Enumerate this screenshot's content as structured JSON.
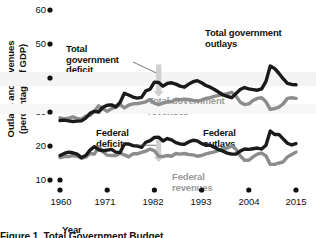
{
  "figure": {
    "caption": "Figure 1. Total Government Budget",
    "xlabel": "Year",
    "ylabel_line1": "Outlays and revenues",
    "ylabel_line2": "(percentage of GDP)"
  },
  "labels": {
    "total_deficit": "Total\ngovernment\ndeficit",
    "total_deficit_l1": "Total",
    "total_deficit_l2": "government",
    "total_deficit_l3": "deficit",
    "total_outlays_l1": "Total government",
    "total_outlays_l2": "outlays",
    "total_revenues_l1": "Total government",
    "total_revenues_l2": "revenues",
    "federal_deficit_l1": "Federal",
    "federal_deficit_l2": "deficit",
    "federal_outlays_l1": "Federal",
    "federal_outlays_l2": "outlays",
    "federal_revenues_l1": "Federal",
    "federal_revenues_l2": "revenues"
  },
  "colors": {
    "outlays": "#1a1a1a",
    "revenues": "#8c8c8c",
    "arrow": "#d0d0d0",
    "band": "#f2f2f2",
    "text": "#111111",
    "gray_text": "#9a9a9a"
  },
  "chart_data": {
    "type": "line",
    "title": "Figure 1. Total Government Budget",
    "xlabel": "Year",
    "ylabel": "Outlays and revenues (percentage of GDP)",
    "xlim": [
      1960,
      2015
    ],
    "ylim": [
      10,
      60
    ],
    "xticks": [
      1960,
      1971,
      1982,
      1993,
      2004,
      2015
    ],
    "yticks": [
      10,
      20,
      30,
      40,
      50,
      60
    ],
    "grid": false,
    "legend": "inline-annotations",
    "annotations": [
      {
        "text": "Total government deficit",
        "target": "gap between total outlays and total revenues",
        "year": 1983
      },
      {
        "text": "Federal deficit",
        "target": "gap between federal outlays and federal revenues",
        "year": 1983
      }
    ],
    "x": [
      1960,
      1961,
      1962,
      1963,
      1964,
      1965,
      1966,
      1967,
      1968,
      1969,
      1970,
      1971,
      1972,
      1973,
      1974,
      1975,
      1976,
      1977,
      1978,
      1979,
      1980,
      1981,
      1982,
      1983,
      1984,
      1985,
      1986,
      1987,
      1988,
      1989,
      1990,
      1991,
      1992,
      1993,
      1994,
      1995,
      1996,
      1997,
      1998,
      1999,
      2000,
      2001,
      2002,
      2003,
      2004,
      2005,
      2006,
      2007,
      2008,
      2009,
      2010,
      2011,
      2012,
      2013,
      2014,
      2015
    ],
    "series": [
      {
        "name": "Total government outlays",
        "color": "#1a1a1a",
        "values": [
          27.5,
          27.6,
          27.4,
          27.2,
          27.3,
          27.4,
          28.2,
          29.6,
          30.2,
          30.0,
          31.4,
          32.0,
          32.1,
          31.5,
          32.8,
          35.5,
          35.0,
          34.4,
          34.1,
          34.3,
          36.2,
          36.7,
          38.8,
          38.7,
          37.6,
          38.4,
          38.6,
          38.2,
          37.6,
          37.3,
          38.2,
          38.9,
          39.2,
          38.6,
          37.8,
          37.3,
          36.6,
          35.8,
          35.0,
          34.6,
          34.2,
          35.4,
          36.6,
          37.2,
          36.8,
          36.6,
          36.4,
          36.8,
          39.0,
          43.5,
          42.8,
          41.4,
          39.8,
          38.4,
          38.1,
          38.0
        ]
      },
      {
        "name": "Total government revenues",
        "color": "#8c8c8c",
        "values": [
          28.3,
          28.0,
          28.2,
          28.6,
          28.1,
          27.9,
          28.8,
          29.0,
          30.2,
          31.8,
          31.0,
          30.2,
          31.0,
          31.4,
          32.2,
          31.2,
          32.0,
          32.4,
          32.5,
          32.7,
          33.0,
          33.7,
          32.6,
          32.2,
          32.6,
          33.0,
          33.0,
          33.8,
          33.6,
          33.8,
          33.7,
          33.4,
          33.2,
          33.5,
          34.0,
          34.2,
          34.6,
          34.9,
          35.2,
          35.4,
          35.8,
          34.7,
          32.9,
          32.2,
          32.4,
          33.4,
          34.0,
          34.2,
          33.0,
          30.8,
          31.0,
          31.4,
          32.4,
          34.0,
          34.2,
          34.0
        ]
      },
      {
        "name": "Federal outlays",
        "color": "#1a1a1a",
        "values": [
          17.2,
          17.8,
          18.2,
          18.0,
          17.6,
          16.6,
          17.2,
          18.8,
          19.8,
          18.9,
          18.6,
          18.8,
          19.0,
          18.2,
          18.1,
          20.6,
          20.6,
          20.1,
          20.0,
          19.6,
          21.1,
          21.6,
          22.5,
          22.6,
          21.5,
          22.2,
          21.8,
          21.0,
          20.6,
          20.5,
          21.2,
          21.7,
          21.5,
          20.7,
          20.3,
          20.2,
          19.6,
          18.9,
          18.5,
          17.9,
          17.6,
          17.6,
          18.5,
          19.1,
          19.0,
          19.2,
          19.4,
          19.1,
          20.2,
          24.4,
          23.4,
          23.4,
          22.1,
          20.8,
          20.3,
          20.7
        ]
      },
      {
        "name": "Federal revenues",
        "color": "#8c8c8c",
        "values": [
          16.6,
          16.9,
          16.9,
          17.2,
          17.0,
          16.4,
          16.7,
          17.8,
          17.6,
          19.7,
          18.4,
          17.3,
          17.2,
          17.2,
          17.8,
          17.4,
          16.8,
          17.7,
          17.7,
          18.1,
          18.5,
          19.1,
          18.6,
          17.0,
          16.9,
          17.2,
          17.0,
          17.8,
          17.6,
          17.8,
          17.5,
          17.4,
          17.0,
          17.2,
          17.7,
          18.0,
          18.3,
          18.7,
          19.3,
          19.4,
          20.1,
          19.1,
          17.1,
          15.8,
          15.8,
          16.8,
          17.6,
          17.9,
          17.1,
          14.6,
          14.6,
          15.0,
          15.3,
          16.8,
          17.5,
          18.2
        ]
      }
    ]
  },
  "axis": {
    "yticks": [
      "60",
      "50",
      "40",
      "30",
      "20",
      "10"
    ],
    "xticks": [
      "1960",
      "1971",
      "1982",
      "1993",
      "2004",
      "2015"
    ]
  }
}
